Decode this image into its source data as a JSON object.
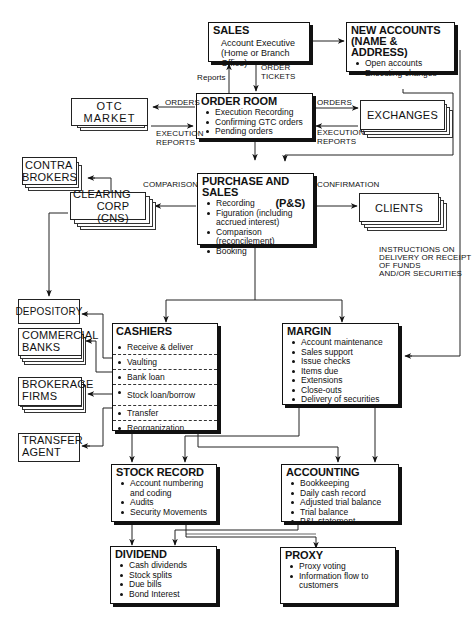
{
  "diagram": {
    "nodes": {
      "sales": {
        "title": "SALES",
        "subtitle_lines": [
          "Account Executive",
          "(Home or Branch Office)"
        ]
      },
      "new_accounts": {
        "title_lines": [
          "NEW ACCOUNTS",
          "(NAME & ADDRESS)"
        ],
        "items": [
          "Open accounts",
          "Executing changes"
        ]
      },
      "order_room": {
        "title": "ORDER ROOM",
        "items": [
          "Execution Recording",
          "Confirming GTC orders",
          "Pending orders"
        ]
      },
      "otc_market": {
        "label": "OTC MARKET"
      },
      "exchanges": {
        "label": "EXCHANGES"
      },
      "contra_brokers": {
        "label_lines": [
          "CONTRA",
          "BROKERS"
        ]
      },
      "clearing_corp": {
        "label_lines": [
          "CLEARING",
          "CORP (CNS)"
        ]
      },
      "purchase_sales": {
        "title": "PURCHASE AND SALES",
        "title_suffix": "(P&S)",
        "items": [
          "Recording",
          "Figuration (including",
          "accrued interest)",
          "Comparison (reconcilement)",
          "Booking"
        ]
      },
      "clients": {
        "label": "CLIENTS"
      },
      "depository": {
        "label": "DEPOSITORY"
      },
      "commercial_banks": {
        "label_lines": [
          "COMMERCIAL",
          "BANKS"
        ]
      },
      "brokerage_firms": {
        "label_lines": [
          "BROKERAGE",
          "FIRMS"
        ]
      },
      "transfer_agent": {
        "label_lines": [
          "TRANSFER",
          "AGENT"
        ]
      },
      "cashiers": {
        "title": "CASHIERS",
        "rows": [
          "Receive & deliver",
          "Vaulting",
          "Bank loan",
          "Stock loan/borrow",
          "Transfer",
          "Reorganization"
        ]
      },
      "margin": {
        "title": "MARGIN",
        "items": [
          "Account maintenance",
          "Sales support",
          "Issue checks",
          "Items due",
          "Extensions",
          "Close-outs",
          "Delivery of securities"
        ]
      },
      "stock_record": {
        "title": "STOCK RECORD",
        "items": [
          "Account numbering",
          "and coding",
          "Audits",
          "Security Movements"
        ]
      },
      "accounting": {
        "title": "ACCOUNTING",
        "items": [
          "Bookkeeping",
          "Daily cash record",
          "Adjusted trial balance",
          "Trial balance",
          "P&L statement"
        ]
      },
      "dividend": {
        "title": "DIVIDEND",
        "items": [
          "Cash dividends",
          "Stock splits",
          "Due bills",
          "Bond Interest"
        ]
      },
      "proxy": {
        "title": "PROXY",
        "items": [
          "Proxy voting",
          "Information flow to",
          "customers"
        ]
      }
    },
    "edge_labels": {
      "reports": "Reports",
      "order_tickets": [
        "ORDER",
        "TICKETS"
      ],
      "orders_left": "ORDERS",
      "orders_right": "ORDERS",
      "execution_reports_left": [
        "EXECUTION",
        "REPORTS"
      ],
      "execution_reports_right": [
        "EXECUTION",
        "REPORTS"
      ],
      "comparisons": "COMPARISONS",
      "confirmation": "CONFIRMATION",
      "instructions": [
        "INSTRUCTIONS ON",
        "DELIVERY OR RECEIPT",
        "OF FUNDS",
        "AND/OR SECURITIES"
      ]
    }
  }
}
